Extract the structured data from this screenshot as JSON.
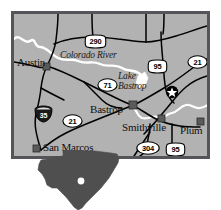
{
  "map": {
    "title": "Central Texas Locator Map",
    "background_color": "#b2b2b2",
    "border_color": "#555559",
    "road_color": "#000000",
    "water_color": "#ffffff",
    "state_fill": "#4f4f4f",
    "cities": [
      {
        "name": "Austin",
        "marker": "square",
        "x": 25,
        "y": 56
      },
      {
        "name": "Bastrop",
        "marker": "square",
        "x": 108,
        "y": 96
      },
      {
        "name": "Smithville",
        "marker": "square",
        "x": 137,
        "y": 116
      },
      {
        "name": "Plum",
        "marker": "square",
        "x": 184,
        "y": 116
      },
      {
        "name": "San Marcos",
        "marker": "square",
        "x": 36,
        "y": 141
      }
    ],
    "point_of_interest": {
      "name": "star-marker",
      "x": 168,
      "y": 88
    },
    "water_features": [
      {
        "name": "Colorado River",
        "type": "river",
        "x": 57,
        "y": 47
      },
      {
        "name": "Lake Bastrop",
        "type": "lake",
        "x": 124,
        "y": 66
      }
    ],
    "highways": [
      {
        "number": "290",
        "type": "us",
        "x": 93,
        "y": 38
      },
      {
        "number": "95",
        "type": "us",
        "x": 152,
        "y": 59
      },
      {
        "number": "21",
        "type": "state",
        "x": 192,
        "y": 55
      },
      {
        "number": "71",
        "type": "state",
        "x": 102,
        "y": 78
      },
      {
        "number": "35",
        "type": "interstate",
        "x": 38,
        "y": 106
      },
      {
        "number": "21",
        "type": "state",
        "x": 67,
        "y": 115
      },
      {
        "number": "304",
        "type": "state",
        "x": 142,
        "y": 142
      },
      {
        "number": "95",
        "type": "us",
        "x": 170,
        "y": 143
      }
    ],
    "state_inset": {
      "name": "Texas",
      "locator_dot": true
    }
  }
}
